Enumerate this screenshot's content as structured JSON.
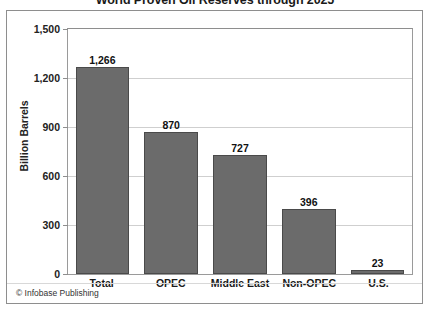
{
  "chart_data": {
    "type": "bar",
    "title": "World Proven Oil Reserves through 2025",
    "xlabel": "",
    "ylabel": "Billion Barrels",
    "categories": [
      "Total",
      "OPEC",
      "Middle East",
      "Non-OPEC",
      "U.S."
    ],
    "values": [
      1266,
      870,
      727,
      396,
      23
    ],
    "value_labels": [
      "1,266",
      "870",
      "727",
      "396",
      "23"
    ],
    "ylim": [
      0,
      1500
    ],
    "ytick_values": [
      0,
      300,
      600,
      900,
      1200,
      1500
    ],
    "ytick_labels": [
      "0",
      "300",
      "600",
      "900",
      "1,200",
      "1,500"
    ],
    "grid": true,
    "legend": false,
    "bar_color": "#6b6b6b",
    "bar_edge_color": "#4a4a4a",
    "gridline_color": "#cfcfcf",
    "axis_color": "#8e8e8e",
    "background_color": "#ffffff"
  },
  "footer": {
    "credit": "© Infobase Publishing"
  }
}
